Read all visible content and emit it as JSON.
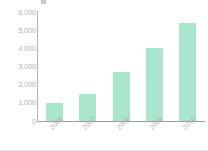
{
  "chart_data": {
    "type": "bar",
    "title": "",
    "xlabel": "",
    "ylabel": "",
    "categories": [
      "2006",
      "2007",
      "2008",
      "2009",
      "2010"
    ],
    "values": [
      1000,
      1500,
      2700,
      4000,
      5400
    ],
    "ylim": [
      0,
      6000
    ],
    "ytick_labels": [
      "6.000",
      "5.000",
      "4.000",
      "3.000",
      "2.000",
      "1.000",
      "0"
    ],
    "ytick_values": [
      6000,
      5000,
      4000,
      3000,
      2000,
      1000,
      0
    ],
    "grid": false,
    "legend": null,
    "bar_color": "#a9e6cd",
    "axis_color": "#a8a8a8",
    "label_color": "#b0b0b0"
  },
  "figure": {
    "title_clipped": "",
    "background": "#ffffff"
  }
}
